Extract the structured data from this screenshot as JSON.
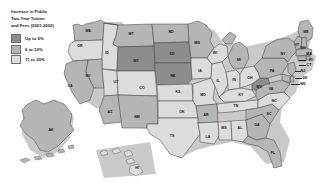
{
  "figure": {
    "type": "choropleth-map",
    "region": "United States",
    "background_color": "#ffffff"
  },
  "legend": {
    "title_lines": [
      "Increase in Public",
      "Two-Year Tuition",
      "and Fees (2001-2002)"
    ],
    "items": [
      {
        "label": "Up to 5%",
        "color": "#8d8d8d"
      },
      {
        "label": "6 to 10%",
        "color": "#b5b5b5"
      },
      {
        "label": "11 to 20%",
        "color": "#dcdcdc"
      }
    ]
  },
  "map": {
    "colors": {
      "up_to_5": "#8d8d8d",
      "six_to_ten": "#b5b5b5",
      "eleven_to_twenty": "#dcdcdc",
      "border": "#4a4a4a",
      "shadow": "#c9c9c9"
    },
    "states": [
      {
        "code": "WA",
        "name": "Washington",
        "bucket": "six_to_ten",
        "lx": 88,
        "ly": 31
      },
      {
        "code": "OR",
        "name": "Oregon",
        "bucket": "eleven_to_twenty",
        "lx": 80,
        "ly": 46
      },
      {
        "code": "ID",
        "name": "Idaho",
        "bucket": "eleven_to_twenty",
        "lx": 107,
        "ly": 53
      },
      {
        "code": "MT",
        "name": "Montana",
        "bucket": "six_to_ten",
        "lx": 131,
        "ly": 34
      },
      {
        "code": "WY",
        "name": "Wyoming",
        "bucket": "up_to_5",
        "lx": 136,
        "ly": 61
      },
      {
        "code": "ND",
        "name": "North Dakota",
        "bucket": "six_to_ten",
        "lx": 171,
        "ly": 32
      },
      {
        "code": "SD",
        "name": "South Dakota",
        "bucket": "up_to_5",
        "lx": 172,
        "ly": 54
      },
      {
        "code": "NE",
        "name": "Nebraska",
        "bucket": "up_to_5",
        "lx": 173,
        "ly": 76
      },
      {
        "code": "MN",
        "name": "Minnesota",
        "bucket": "six_to_ten",
        "lx": 197,
        "ly": 43
      },
      {
        "code": "IA",
        "name": "Iowa",
        "bucket": "eleven_to_twenty",
        "lx": 200,
        "ly": 71
      },
      {
        "code": "WI",
        "name": "Wisconsin",
        "bucket": "eleven_to_twenty",
        "lx": 215,
        "ly": 53
      },
      {
        "code": "MI",
        "name": "Michigan",
        "bucket": "six_to_ten",
        "lx": 239,
        "ly": 60
      },
      {
        "code": "CA",
        "name": "California",
        "bucket": "six_to_ten",
        "lx": 70,
        "ly": 86
      },
      {
        "code": "NV",
        "name": "Nevada",
        "bucket": "six_to_ten",
        "lx": 88,
        "ly": 76
      },
      {
        "code": "UT",
        "name": "Utah",
        "bucket": "eleven_to_twenty",
        "lx": 116,
        "ly": 82
      },
      {
        "code": "CO",
        "name": "Colorado",
        "bucket": "eleven_to_twenty",
        "lx": 142,
        "ly": 88
      },
      {
        "code": "KS",
        "name": "Kansas",
        "bucket": "eleven_to_twenty",
        "lx": 178,
        "ly": 92
      },
      {
        "code": "MO",
        "name": "Missouri",
        "bucket": "eleven_to_twenty",
        "lx": 203,
        "ly": 95
      },
      {
        "code": "IL",
        "name": "Illinois",
        "bucket": "eleven_to_twenty",
        "lx": 218,
        "ly": 81
      },
      {
        "code": "IN",
        "name": "Indiana",
        "bucket": "eleven_to_twenty",
        "lx": 234,
        "ly": 80
      },
      {
        "code": "OH",
        "name": "Ohio",
        "bucket": "eleven_to_twenty",
        "lx": 250,
        "ly": 78
      },
      {
        "code": "PA",
        "name": "Pennsylvania",
        "bucket": "six_to_ten",
        "lx": 272,
        "ly": 71
      },
      {
        "code": "NY",
        "name": "New York",
        "bucket": "six_to_ten",
        "lx": 283,
        "ly": 54
      },
      {
        "code": "ME",
        "name": "Maine",
        "bucket": "six_to_ten",
        "lx": 306,
        "ly": 32
      },
      {
        "code": "AZ",
        "name": "Arizona",
        "bucket": "six_to_ten",
        "lx": 110,
        "ly": 112
      },
      {
        "code": "NM",
        "name": "New Mexico",
        "bucket": "six_to_ten",
        "lx": 137,
        "ly": 117
      },
      {
        "code": "OK",
        "name": "Oklahoma",
        "bucket": "eleven_to_twenty",
        "lx": 182,
        "ly": 112
      },
      {
        "code": "AR",
        "name": "Arkansas",
        "bucket": "six_to_ten",
        "lx": 206,
        "ly": 115
      },
      {
        "code": "TX",
        "name": "Texas",
        "bucket": "eleven_to_twenty",
        "lx": 172,
        "ly": 136
      },
      {
        "code": "LA",
        "name": "Louisiana",
        "bucket": "eleven_to_twenty",
        "lx": 208,
        "ly": 137
      },
      {
        "code": "MS",
        "name": "Mississippi",
        "bucket": "eleven_to_twenty",
        "lx": 224,
        "ly": 128
      },
      {
        "code": "AL",
        "name": "Alabama",
        "bucket": "eleven_to_twenty",
        "lx": 240,
        "ly": 128
      },
      {
        "code": "GA",
        "name": "Georgia",
        "bucket": "six_to_ten",
        "lx": 257,
        "ly": 125
      },
      {
        "code": "FL",
        "name": "Florida",
        "bucket": "six_to_ten",
        "lx": 273,
        "ly": 153
      },
      {
        "code": "SC",
        "name": "South Carolina",
        "bucket": "six_to_ten",
        "lx": 269,
        "ly": 114
      },
      {
        "code": "NC",
        "name": "North Carolina",
        "bucket": "eleven_to_twenty",
        "lx": 274,
        "ly": 101
      },
      {
        "code": "TN",
        "name": "Tennessee",
        "bucket": "eleven_to_twenty",
        "lx": 236,
        "ly": 106
      },
      {
        "code": "KY",
        "name": "Kentucky",
        "bucket": "eleven_to_twenty",
        "lx": 241,
        "ly": 95
      },
      {
        "code": "VA",
        "name": "Virginia",
        "bucket": "six_to_ten",
        "lx": 271,
        "ly": 89
      },
      {
        "code": "WV",
        "name": "West Virginia",
        "bucket": "up_to_5",
        "lx": 259,
        "ly": 87
      },
      {
        "code": "VT",
        "name": "Vermont",
        "bucket": "six_to_ten",
        "lx": 297,
        "ly": 45
      },
      {
        "code": "NH",
        "name": "New Hampshire",
        "bucket": "six_to_ten",
        "lx": 303,
        "ly": 48
      },
      {
        "code": "MA",
        "name": "Massachusetts",
        "bucket": "six_to_ten",
        "lx": 309,
        "ly": 54
      },
      {
        "code": "RI",
        "name": "Rhode Island",
        "bucket": "six_to_ten",
        "lx": 311,
        "ly": 60
      },
      {
        "code": "CT",
        "name": "Connecticut",
        "bucket": "six_to_ten",
        "lx": 309,
        "ly": 65
      },
      {
        "code": "NJ",
        "name": "New Jersey",
        "bucket": "six_to_ten",
        "lx": 303,
        "ly": 71
      },
      {
        "code": "DE",
        "name": "Delaware",
        "bucket": "six_to_ten",
        "lx": 305,
        "ly": 78
      },
      {
        "code": "MD",
        "name": "Maryland",
        "bucket": "six_to_ten",
        "lx": 303,
        "ly": 84
      },
      {
        "code": "AK",
        "name": "Alaska",
        "bucket": "six_to_ten",
        "lx": 51,
        "ly": 130
      },
      {
        "code": "HI",
        "name": "Hawaii",
        "bucket": "eleven_to_twenty",
        "lx": 137,
        "ly": 168
      }
    ]
  }
}
